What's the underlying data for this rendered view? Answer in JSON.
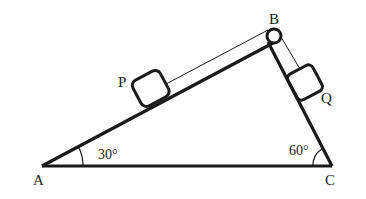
{
  "diagram": {
    "vertices": {
      "A": {
        "label": "A"
      },
      "B": {
        "label": "B"
      },
      "C": {
        "label": "C"
      }
    },
    "blocks": {
      "P": {
        "label": "P"
      },
      "Q": {
        "label": "Q"
      }
    },
    "angles": {
      "A": {
        "label": "30°"
      },
      "C": {
        "label": "60°"
      }
    },
    "colors": {
      "stroke": "#1a1a1a",
      "background": "#ffffff"
    }
  }
}
